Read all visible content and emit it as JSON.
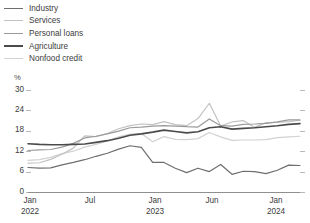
{
  "legend": {
    "position": "top-left",
    "items": [
      {
        "label": "Industry",
        "color": "#6e6e6e",
        "width": 1.5
      },
      {
        "label": "Services",
        "color": "#c2c2c2",
        "width": 1.5
      },
      {
        "label": "Personal loans",
        "color": "#9a9a9a",
        "width": 1.5
      },
      {
        "label": "Agriculture",
        "color": "#4a4a4a",
        "width": 2.0
      },
      {
        "label": "Nonfood credit",
        "color": "#d2d2d2",
        "width": 1.5
      }
    ]
  },
  "axes": {
    "y_unit": "%",
    "y_ticks": [
      "30",
      "24",
      "18",
      "12",
      "6",
      "0"
    ],
    "x_ticks": [
      {
        "line1": "Jan",
        "line2": "2022"
      },
      {
        "line1": "Jul",
        "line2": ""
      },
      {
        "line1": "Jan",
        "line2": "2023"
      },
      {
        "line1": "Jun",
        "line2": ""
      },
      {
        "line1": "Jan",
        "line2": "2024"
      }
    ]
  },
  "chart_data": {
    "type": "line",
    "title": "",
    "subtitle": "",
    "xlabel": "",
    "ylabel": "%",
    "ylim": [
      0,
      30
    ],
    "ytick_values": [
      0,
      6,
      12,
      18,
      24,
      30
    ],
    "grid": false,
    "legend_position": "top-left",
    "x": [
      "Jan 2022",
      "Feb 2022",
      "Mar 2022",
      "Apr 2022",
      "May 2022",
      "Jun 2022",
      "Jul 2022",
      "Aug 2022",
      "Sep 2022",
      "Oct 2022",
      "Nov 2022",
      "Dec 2022",
      "Jan 2023",
      "Feb 2023",
      "Mar 2023",
      "Apr 2023",
      "May 2023",
      "Jun 2023",
      "Jul 2023",
      "Aug 2023",
      "Sep 2023",
      "Oct 2023",
      "Nov 2023",
      "Dec 2023",
      "Jan 2024"
    ],
    "xtick_labels": [
      "Jan 2022",
      "Jul",
      "Jan 2023",
      "Jun",
      "Jan 2024"
    ],
    "series": [
      {
        "name": "Industry",
        "color": "#6e6e6e",
        "values": [
          7.2,
          7.0,
          7.1,
          8.0,
          8.7,
          9.5,
          10.5,
          11.4,
          12.6,
          13.6,
          13.1,
          8.7,
          8.7,
          7.0,
          5.7,
          7.0,
          6.0,
          8.1,
          5.2,
          6.1,
          6.0,
          5.4,
          6.4,
          7.9,
          7.8
        ]
      },
      {
        "name": "Services",
        "color": "#c2c2c2",
        "values": [
          8.5,
          8.6,
          9.6,
          11.1,
          12.9,
          16.5,
          16.3,
          17.2,
          18.6,
          19.5,
          20.0,
          19.8,
          20.7,
          19.8,
          19.5,
          21.6,
          26.1,
          19.4,
          20.6,
          21.0,
          19.0,
          20.4,
          20.5,
          20.7,
          21.1
        ]
      },
      {
        "name": "Personal loans",
        "color": "#9a9a9a",
        "values": [
          12.2,
          12.4,
          12.5,
          13.2,
          14.3,
          15.9,
          16.4,
          17.1,
          17.9,
          18.9,
          19.1,
          19.4,
          19.5,
          19.4,
          19.2,
          19.1,
          21.5,
          19.5,
          19.4,
          19.9,
          20.0,
          20.2,
          20.6,
          21.2,
          21.2
        ]
      },
      {
        "name": "Agriculture",
        "color": "#4a4a4a",
        "values": [
          14.2,
          14.0,
          13.9,
          13.9,
          14.0,
          14.1,
          14.6,
          15.1,
          15.8,
          16.7,
          17.1,
          17.6,
          18.2,
          17.8,
          17.4,
          17.7,
          18.9,
          19.2,
          18.5,
          18.7,
          18.9,
          19.2,
          19.5,
          19.9,
          20.1
        ]
      },
      {
        "name": "Nonfood credit",
        "color": "#d2d2d2",
        "values": [
          9.3,
          9.5,
          10.2,
          11.3,
          12.0,
          13.2,
          14.0,
          15.0,
          16.2,
          17.0,
          17.2,
          14.8,
          16.3,
          15.5,
          15.4,
          15.7,
          17.5,
          16.2,
          15.2,
          15.3,
          15.3,
          15.4,
          16.0,
          16.2,
          16.4
        ]
      }
    ]
  }
}
